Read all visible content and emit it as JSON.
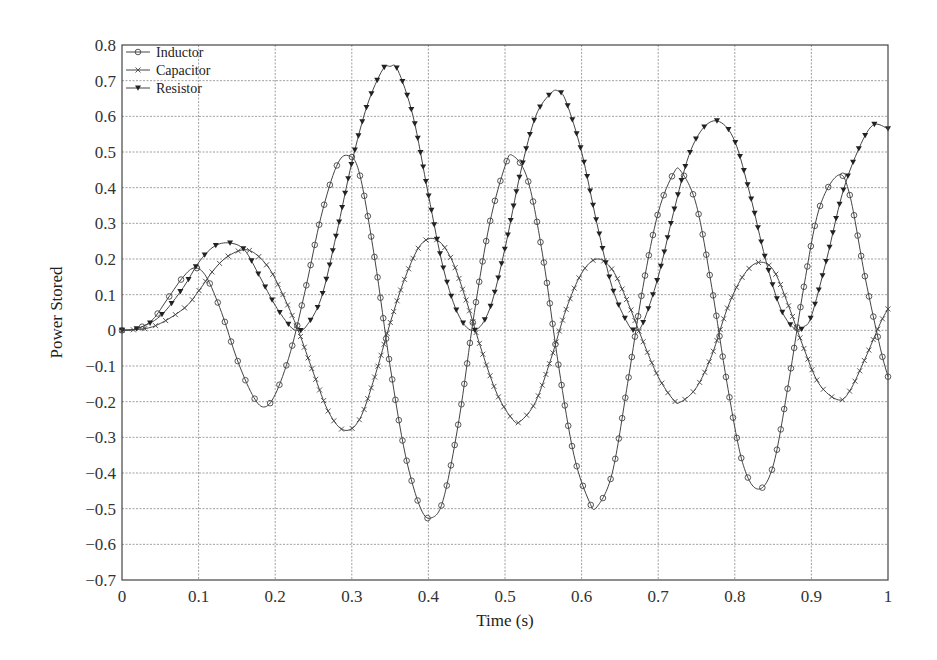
{
  "chart_data": {
    "type": "line",
    "title": "",
    "xlabel": "Time (s)",
    "ylabel": "Power Stored",
    "xlim": [
      0,
      1
    ],
    "ylim": [
      -0.7,
      0.8
    ],
    "xticks": [
      "0",
      "0.1",
      "0.2",
      "0.3",
      "0.4",
      "0.5",
      "0.6",
      "0.7",
      "0.8",
      "0.9",
      "1"
    ],
    "yticks": [
      "0.8",
      "0.7",
      "0.6",
      "0.5",
      "0.4",
      "0.3",
      "0.2",
      "0.1",
      "0",
      "−0.1",
      "−0.2",
      "−0.3",
      "−0.4",
      "−0.5",
      "−0.6",
      "−0.7"
    ],
    "grid": true,
    "legend_position": "upper-left",
    "series": [
      {
        "name": "Inductor",
        "marker": "circle",
        "x": [
          0,
          0.02,
          0.04,
          0.06,
          0.08,
          0.095,
          0.11,
          0.13,
          0.15,
          0.17,
          0.185,
          0.2,
          0.22,
          0.24,
          0.26,
          0.28,
          0.295,
          0.31,
          0.33,
          0.35,
          0.37,
          0.39,
          0.405,
          0.42,
          0.44,
          0.46,
          0.48,
          0.5,
          0.51,
          0.53,
          0.55,
          0.57,
          0.59,
          0.61,
          0.62,
          0.64,
          0.66,
          0.68,
          0.7,
          0.72,
          0.73,
          0.75,
          0.77,
          0.79,
          0.81,
          0.83,
          0.85,
          0.87,
          0.89,
          0.91,
          0.935,
          0.95,
          0.97,
          0.99,
          1.0
        ],
        "y": [
          0,
          0.005,
          0.03,
          0.09,
          0.15,
          0.175,
          0.15,
          0.05,
          -0.08,
          -0.18,
          -0.215,
          -0.18,
          -0.06,
          0.12,
          0.32,
          0.46,
          0.49,
          0.44,
          0.2,
          -0.1,
          -0.35,
          -0.5,
          -0.525,
          -0.47,
          -0.25,
          0.05,
          0.3,
          0.46,
          0.49,
          0.42,
          0.2,
          -0.1,
          -0.35,
          -0.48,
          -0.495,
          -0.4,
          -0.15,
          0.12,
          0.33,
          0.44,
          0.445,
          0.35,
          0.12,
          -0.15,
          -0.37,
          -0.445,
          -0.38,
          -0.15,
          0.12,
          0.34,
          0.435,
          0.38,
          0.15,
          -0.05,
          -0.13
        ]
      },
      {
        "name": "Capacitor",
        "marker": "x",
        "x": [
          0,
          0.04,
          0.08,
          0.1,
          0.12,
          0.14,
          0.165,
          0.19,
          0.21,
          0.23,
          0.25,
          0.27,
          0.29,
          0.31,
          0.33,
          0.35,
          0.37,
          0.39,
          0.41,
          0.43,
          0.45,
          0.47,
          0.49,
          0.51,
          0.52,
          0.54,
          0.56,
          0.58,
          0.6,
          0.62,
          0.64,
          0.66,
          0.68,
          0.7,
          0.72,
          0.73,
          0.75,
          0.77,
          0.79,
          0.81,
          0.83,
          0.85,
          0.87,
          0.89,
          0.91,
          0.935,
          0.95,
          0.97,
          0.99,
          1.0
        ],
        "y": [
          0,
          0.01,
          0.06,
          0.11,
          0.17,
          0.21,
          0.225,
          0.18,
          0.1,
          0,
          -0.12,
          -0.23,
          -0.28,
          -0.25,
          -0.13,
          0.02,
          0.15,
          0.24,
          0.255,
          0.2,
          0.08,
          -0.06,
          -0.18,
          -0.25,
          -0.255,
          -0.2,
          -0.08,
          0.06,
          0.16,
          0.2,
          0.17,
          0.08,
          -0.03,
          -0.13,
          -0.195,
          -0.2,
          -0.16,
          -0.07,
          0.06,
          0.15,
          0.19,
          0.17,
          0.07,
          -0.05,
          -0.15,
          -0.195,
          -0.17,
          -0.08,
          0.02,
          0.06
        ]
      },
      {
        "name": "Resistor",
        "marker": "triangle-down",
        "x": [
          0,
          0.02,
          0.05,
          0.08,
          0.1,
          0.12,
          0.14,
          0.16,
          0.18,
          0.2,
          0.22,
          0.23,
          0.24,
          0.26,
          0.28,
          0.3,
          0.32,
          0.34,
          0.35,
          0.36,
          0.38,
          0.4,
          0.42,
          0.44,
          0.46,
          0.48,
          0.5,
          0.52,
          0.54,
          0.56,
          0.57,
          0.58,
          0.6,
          0.62,
          0.64,
          0.66,
          0.67,
          0.68,
          0.7,
          0.72,
          0.74,
          0.76,
          0.78,
          0.8,
          0.82,
          0.84,
          0.86,
          0.88,
          0.89,
          0.9,
          0.92,
          0.94,
          0.96,
          0.98,
          1.0
        ],
        "y": [
          0,
          0.005,
          0.04,
          0.12,
          0.19,
          0.235,
          0.245,
          0.225,
          0.15,
          0.07,
          0.01,
          0,
          0.01,
          0.09,
          0.27,
          0.47,
          0.63,
          0.73,
          0.74,
          0.73,
          0.6,
          0.38,
          0.17,
          0.04,
          0,
          0.06,
          0.23,
          0.44,
          0.6,
          0.665,
          0.67,
          0.64,
          0.5,
          0.3,
          0.12,
          0.02,
          0,
          0.02,
          0.15,
          0.33,
          0.49,
          0.57,
          0.585,
          0.53,
          0.38,
          0.2,
          0.06,
          0,
          0.01,
          0.04,
          0.2,
          0.38,
          0.5,
          0.575,
          0.565
        ]
      }
    ]
  }
}
